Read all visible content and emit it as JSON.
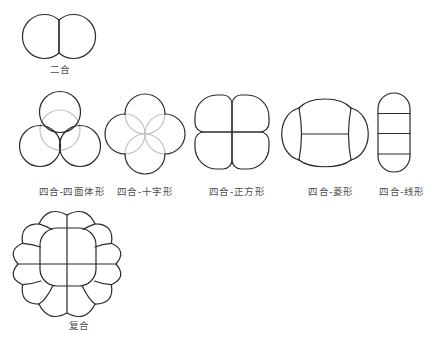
{
  "figure": {
    "labels": {
      "two_cell": "二合",
      "four_tetrahedron": "四合-四面体形",
      "four_cross": "四合-十字形",
      "four_square": "四合-正方形",
      "four_rhombus": "四合-菱形",
      "four_linear": "四合-线形",
      "compound": "复合"
    },
    "colors": {
      "stroke": "#2a2a2a",
      "hidden_stroke": "#bdbdbd",
      "label_text": "#4d4d4d",
      "background": "#ffffff"
    }
  }
}
